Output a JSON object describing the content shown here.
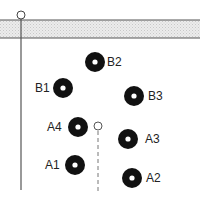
{
  "diagram": {
    "width": 200,
    "height": 198,
    "colors": {
      "line": "#555555",
      "band_fill": "#e2e2e2",
      "ring": "#111111",
      "hole": "#ffffff",
      "text": "#222222"
    },
    "band": {
      "y_top": 20,
      "y_bottom": 38
    },
    "main_probe": {
      "cx": 21,
      "cy": 15,
      "r": 4,
      "line_bottom": 190
    },
    "secondary_probe": {
      "cx": 98,
      "cy": 126,
      "r": 4,
      "line_bottom": 192,
      "style": "dashed"
    },
    "electrodes": [
      {
        "id": "B2",
        "label": "B2",
        "cx": 95,
        "cy": 62
      },
      {
        "id": "B1",
        "label": "B1",
        "cx": 63,
        "cy": 88
      },
      {
        "id": "B3",
        "label": "B3",
        "cx": 134,
        "cy": 96
      },
      {
        "id": "A4",
        "label": "A4",
        "cx": 78,
        "cy": 127
      },
      {
        "id": "A3",
        "label": "A3",
        "cx": 128,
        "cy": 139
      },
      {
        "id": "A1",
        "label": "A1",
        "cx": 75,
        "cy": 165
      },
      {
        "id": "A2",
        "label": "A2",
        "cx": 132,
        "cy": 178
      }
    ],
    "labels": {
      "B2": "B2",
      "B1": "B1",
      "B3": "B3",
      "A4": "A4",
      "A3": "A3",
      "A1": "A1",
      "A2": "A2"
    }
  }
}
